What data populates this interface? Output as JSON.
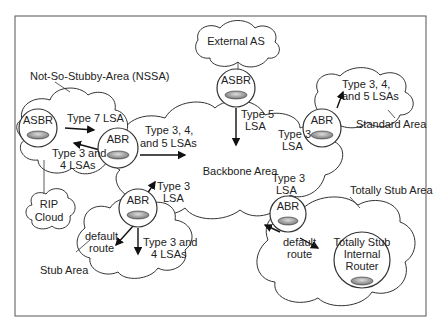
{
  "diagram": {
    "type": "ospf-area-types",
    "areas": {
      "nssa": "Not-So-Stubby-Area (NSSA)",
      "backbone": "Backbone Area",
      "standard": "Standard Area",
      "stub": "Stub Area",
      "totally_stub": "Totally Stub Area",
      "external": "External AS",
      "rip": [
        "RIP",
        "Cloud"
      ]
    },
    "routers": {
      "nssa_asbr": "ASBR",
      "nssa_abr": "ABR",
      "backbone_asbr": "ASBR",
      "standard_abr": "ABR",
      "stub_abr": "ABR",
      "totally_stub_abr": "ABR",
      "totally_stub_internal": [
        "Totally Stub",
        "Internal",
        "Router"
      ]
    },
    "labels": {
      "type7": "Type 7 LSA",
      "nssa_type34": [
        "Type 3 and",
        "4 LSAs"
      ],
      "nssa_to_backbone": [
        "Type 3, 4,",
        "and 5 LSAs"
      ],
      "type5": [
        "Type 5",
        "LSA"
      ],
      "standard_out": [
        "Type 3, 4,",
        "and 5 LSAs"
      ],
      "standard_in": [
        "Type 3",
        "LSA"
      ],
      "stub_up": [
        "Type 3",
        "LSA"
      ],
      "stub_default": [
        "default",
        "route"
      ],
      "stub_type34": [
        "Type 3 and",
        "4 LSAs"
      ],
      "tstub_up": [
        "Type 3",
        "LSA"
      ],
      "tstub_default": [
        "default",
        "route"
      ]
    }
  }
}
